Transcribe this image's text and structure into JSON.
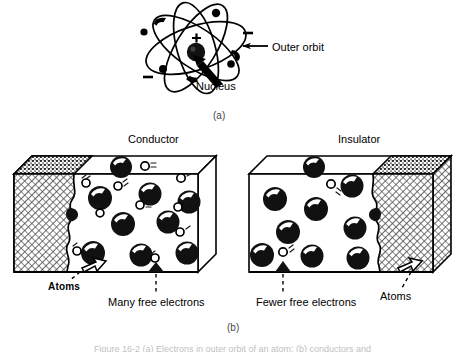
{
  "figure": {
    "panel_a": {
      "tag": "(a)",
      "subject": "atom-model",
      "labels": {
        "outer_orbit": "Outer orbit",
        "nucleus": "Nucleus"
      },
      "nucleus_sign": "+",
      "electron_signs": [
        "–",
        "–",
        "–"
      ]
    },
    "panel_b": {
      "tag": "(b)",
      "conductor": {
        "title": "Conductor",
        "atoms_label": "Atoms",
        "electrons_label": "Many free electrons",
        "atom_count": 9,
        "free_electron_count": 9,
        "cutaway_side": "left"
      },
      "insulator": {
        "title": "Insulator",
        "atoms_label": "Atoms",
        "electrons_label": "Fewer free electrons",
        "atom_count": 9,
        "free_electron_count": 2,
        "cutaway_side": "right"
      }
    },
    "caption": "Figure 16-2 (a) Electrons in outer orbit of an atom; (b) conductors and",
    "colors": {
      "ink": "#000000",
      "hatch": "#9a9a9a",
      "faint": "#bfbfbf"
    }
  }
}
